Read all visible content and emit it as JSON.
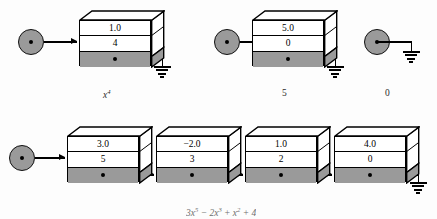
{
  "figure": {
    "type": "linked-list-polynomial-diagram",
    "background_color": "#fdfdfd",
    "ink_color": "#000000",
    "pointer_row_color": "#9a9a9a",
    "node_circle_color": "#9a9a9a"
  },
  "rows": [
    {
      "id": "row-top",
      "chains": [
        {
          "id": "chain-x4",
          "caption": "x",
          "caption_exponent": "4",
          "caption_style": "italic",
          "head": {
            "type": "circle-node",
            "label": "head-pointer"
          },
          "cells": [
            {
              "coefficient": "1.0",
              "exponent": "4",
              "pointer": "null",
              "terminator": "ground"
            }
          ]
        },
        {
          "id": "chain-5",
          "caption": "5",
          "caption_exponent": "",
          "caption_style": "plain",
          "head": {
            "type": "circle-node",
            "label": "head-pointer"
          },
          "cells": [
            {
              "coefficient": "5.0",
              "exponent": "0",
              "pointer": "null",
              "terminator": "ground"
            }
          ]
        },
        {
          "id": "chain-zero",
          "caption": "0",
          "caption_exponent": "",
          "caption_style": "plain",
          "head": {
            "type": "circle-node",
            "label": "head-pointer"
          },
          "cells": [],
          "terminator": "ground"
        }
      ]
    },
    {
      "id": "row-bottom",
      "chains": [
        {
          "id": "chain-polynomial",
          "caption_parts": [
            {
              "coef": "3",
              "var": "x",
              "exp": "5"
            },
            {
              "coef": "− 2",
              "var": "x",
              "exp": "3"
            },
            {
              "coef": "+",
              "var": "x",
              "exp": "2"
            },
            {
              "coef": "+ 4",
              "var": "",
              "exp": ""
            }
          ],
          "caption_style": "italic",
          "head": {
            "type": "circle-node",
            "label": "head-pointer"
          },
          "cells": [
            {
              "coefficient": "3.0",
              "exponent": "5",
              "pointer": "next"
            },
            {
              "coefficient": "−2.0",
              "exponent": "3",
              "pointer": "next"
            },
            {
              "coefficient": "1.0",
              "exponent": "2",
              "pointer": "next"
            },
            {
              "coefficient": "4.0",
              "exponent": "0",
              "pointer": "null",
              "terminator": "ground"
            }
          ]
        }
      ]
    }
  ]
}
